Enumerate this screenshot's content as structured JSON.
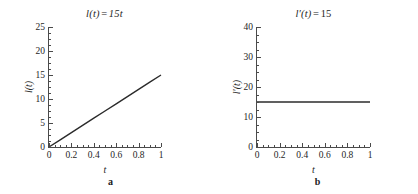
{
  "figure": {
    "panels": [
      {
        "caption": "a",
        "title_parts": {
          "func": "l(t)",
          "op": "=",
          "expr": "15t"
        },
        "title_text": "l(t) = 15t",
        "xlabel": "t",
        "ylabel": "l(t)"
      },
      {
        "caption": "b",
        "title_parts": {
          "func": "l′(t)",
          "op": "=",
          "expr": "15"
        },
        "title_text": "l′(t) = 15",
        "xlabel": "t",
        "ylabel": "l′(t)"
      }
    ]
  },
  "chart_data": [
    {
      "type": "line",
      "title": "l(t) = 15t",
      "xlabel": "t",
      "ylabel": "l(t)",
      "xlim": [
        0,
        1
      ],
      "ylim": [
        0,
        25
      ],
      "xticks": [
        0,
        0.2,
        0.4,
        0.6,
        0.8,
        1
      ],
      "xticklabels": [
        "0",
        "0.2",
        "0.4",
        "0.6",
        "0.8",
        "1"
      ],
      "yticks": [
        0,
        5,
        10,
        15,
        20,
        25
      ],
      "yticklabels": [
        "0",
        "5",
        "10",
        "15",
        "20",
        "25"
      ],
      "x_minor_interval": 0.05,
      "y_minor_interval": 1.25,
      "grid": false,
      "legend": null,
      "line_color": "#2b2b2b",
      "line_width": 1.4,
      "series": [
        {
          "name": "l(t) = 15t",
          "x": [
            0,
            0.1,
            0.2,
            0.3,
            0.4,
            0.5,
            0.6,
            0.7,
            0.8,
            0.9,
            1
          ],
          "values": [
            0,
            1.5,
            3,
            4.5,
            6,
            7.5,
            9,
            10.5,
            12,
            13.5,
            15
          ]
        }
      ]
    },
    {
      "type": "line",
      "title": "l′(t) = 15",
      "xlabel": "t",
      "ylabel": "l′(t)",
      "xlim": [
        0,
        1
      ],
      "ylim": [
        0,
        40
      ],
      "xticks": [
        0,
        0.2,
        0.4,
        0.6,
        0.8,
        1
      ],
      "xticklabels": [
        "0",
        "0.2",
        "0.4",
        "0.6",
        "0.8",
        "1"
      ],
      "yticks": [
        0,
        10,
        20,
        30,
        40
      ],
      "yticklabels": [
        "0",
        "10",
        "20",
        "30",
        "40"
      ],
      "x_minor_interval": 0.05,
      "y_minor_interval": 2.5,
      "grid": false,
      "legend": null,
      "line_color": "#2b2b2b",
      "line_width": 1.4,
      "series": [
        {
          "name": "l′(t) = 15",
          "x": [
            0,
            0.25,
            0.5,
            0.75,
            1
          ],
          "values": [
            15,
            15,
            15,
            15,
            15
          ]
        }
      ]
    }
  ]
}
